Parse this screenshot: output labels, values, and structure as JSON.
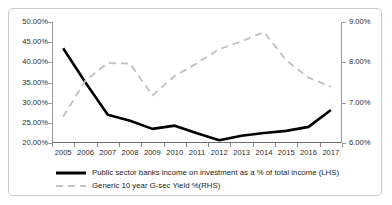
{
  "chart_data": {
    "type": "line",
    "title": "",
    "xlabel": "",
    "grid": false,
    "legend_position": "bottom",
    "categories": [
      "2005",
      "2006",
      "2007",
      "2008",
      "2009",
      "2010",
      "2011",
      "2012",
      "2013",
      "2014",
      "2015",
      "2016",
      "2017"
    ],
    "axes": {
      "left": {
        "label": "",
        "ylim": [
          20,
          50
        ],
        "ticks": [
          20,
          25,
          30,
          35,
          40,
          45,
          50
        ],
        "ticklabels": [
          "20.00%",
          "25.00%",
          "30.00%",
          "35.00%",
          "40.00%",
          "45.00%",
          "50.00%"
        ]
      },
      "right": {
        "label": "",
        "ylim": [
          6,
          9
        ],
        "ticks": [
          6,
          7,
          8,
          9
        ],
        "ticklabels": [
          "6.00%",
          "7.00%",
          "8.00%",
          "9.00%"
        ]
      }
    },
    "series": [
      {
        "name": "Public sector banks income on investment as a % of total income (LHS)",
        "axis": "left",
        "style": "solid",
        "color": "#000000",
        "width": 2.6,
        "values": [
          43.5,
          35.0,
          27.0,
          25.5,
          23.5,
          24.3,
          22.4,
          20.7,
          21.8,
          22.5,
          23.0,
          24.0,
          28.2
        ]
      },
      {
        "name": "Generic 10 year G-sec Yield %(RHS)",
        "axis": "right",
        "style": "dashed",
        "color": "#c2c2c2",
        "width": 1.9,
        "values": [
          6.65,
          7.55,
          7.98,
          7.97,
          7.18,
          7.66,
          7.98,
          8.33,
          8.52,
          8.75,
          8.05,
          7.62,
          7.4
        ]
      }
    ]
  },
  "legend": {
    "items": [
      {
        "label": "Public sector banks income on investment as a % of total income (LHS)",
        "swatch": "solid-line-swatch",
        "color": "#000000"
      },
      {
        "label": "Generic 10 year G-sec Yield %(RHS)",
        "swatch": "dashed-line-swatch",
        "color": "#c2c2c2"
      }
    ]
  }
}
